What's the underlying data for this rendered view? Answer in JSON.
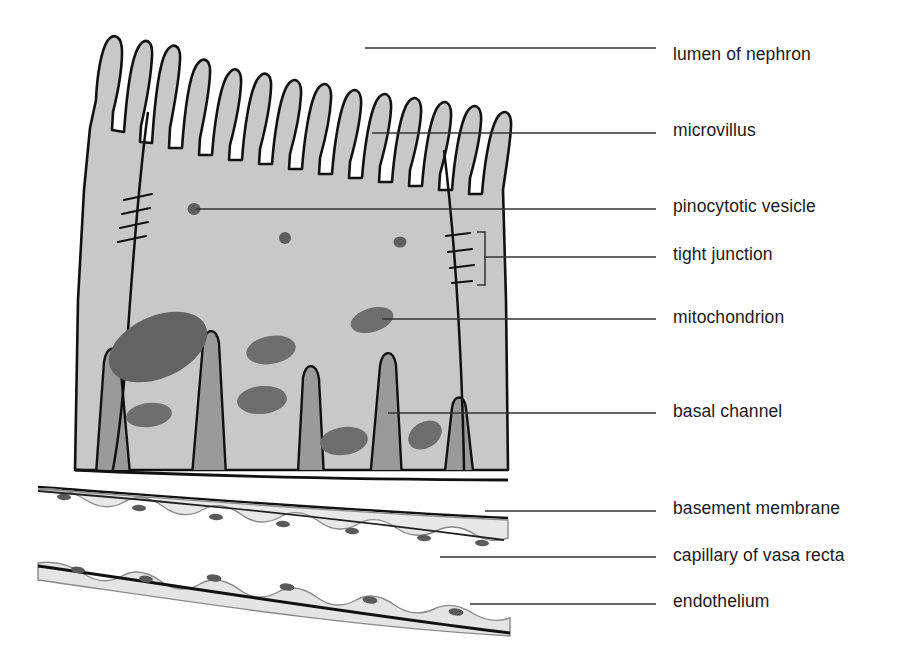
{
  "figure": {
    "background_color": "#ffffff",
    "line_color": "#111111",
    "leader_line_color": "#333333"
  },
  "palette": {
    "cytoplasm": "#c8c8c8",
    "cytoplasm_edge": "#bdbdbd",
    "organelle_dark": "#636363",
    "organelle_mid": "#6e6e6e",
    "basal_channel": "#9a9a9a",
    "membrane_band": "#e8e8e8",
    "endothelium_band": "#e4e4e4",
    "nucleus_dot": "#5a5a5a",
    "white": "#ffffff"
  },
  "labels": [
    {
      "id": "lumen-of-nephron",
      "text": "lumen of nephron",
      "text_x": 673,
      "text_y": 55,
      "leader_x1": 365,
      "leader_x2": 656,
      "leader_y": 48
    },
    {
      "id": "microvillus",
      "text": "microvillus",
      "text_x": 673,
      "text_y": 131,
      "leader_x1": 372,
      "leader_x2": 656,
      "leader_y": 133
    },
    {
      "id": "pinocytotic-vesicle",
      "text": "pinocytotic vesicle",
      "text_x": 673,
      "text_y": 207,
      "leader_x1": 196,
      "leader_x2": 656,
      "leader_y": 209
    },
    {
      "id": "tight-junction",
      "text": "tight junction",
      "text_x": 673,
      "text_y": 255,
      "leader_x1": 484,
      "leader_x2": 656,
      "leader_y": 257
    },
    {
      "id": "mitochondrion",
      "text": "mitochondrion",
      "text_x": 673,
      "text_y": 318,
      "leader_x1": 382,
      "leader_x2": 656,
      "leader_y": 319
    },
    {
      "id": "basal-channel",
      "text": "basal channel",
      "text_x": 673,
      "text_y": 412,
      "leader_x1": 388,
      "leader_x2": 656,
      "leader_y": 413
    },
    {
      "id": "basement-membrane",
      "text": "basement membrane",
      "text_x": 673,
      "text_y": 509,
      "leader_x1": 485,
      "leader_x2": 656,
      "leader_y": 511
    },
    {
      "id": "capillary-of-vasa-recta",
      "text": "capillary of vasa recta",
      "text_x": 673,
      "text_y": 556,
      "leader_x1": 440,
      "leader_x2": 656,
      "leader_y": 557
    },
    {
      "id": "endothelium",
      "text": "endothelium",
      "text_x": 673,
      "text_y": 602,
      "leader_x1": 470,
      "leader_x2": 656,
      "leader_y": 604
    }
  ],
  "diagram_parts": {
    "epithelial_cell": {
      "name": "tubule epithelial cell",
      "left_edge_x": 75,
      "right_edge_x": 510,
      "apex_y": 95,
      "base_y": 470
    },
    "microvilli": {
      "name": "microvilli",
      "count": 15,
      "span_x": [
        88,
        508
      ],
      "tip_y_range": [
        36,
        95
      ]
    },
    "tight_junctions": [
      {
        "name": "left tight junction",
        "x": 136,
        "y_range": [
          198,
          242
        ],
        "hash_count": 4
      },
      {
        "name": "right tight junction",
        "x": 462,
        "y_range": [
          233,
          282
        ],
        "hash_count": 4
      }
    ],
    "tight_junction_bracket": {
      "x": 477,
      "y_top": 232,
      "y_bottom": 285
    },
    "pinocytotic_vesicles": [
      {
        "cx": 194,
        "cy": 209,
        "rx": 6,
        "ry": 5.5
      },
      {
        "cx": 285,
        "cy": 238,
        "rx": 5.5,
        "ry": 5.5
      },
      {
        "cx": 400,
        "cy": 242,
        "rx": 6,
        "ry": 5
      }
    ],
    "nucleus": {
      "cx": 158,
      "cy": 347,
      "rx": 52,
      "ry": 31,
      "rotation": -24
    },
    "mitochondria": [
      {
        "cx": 271,
        "cy": 350,
        "rx": 25,
        "ry": 14,
        "rotation": -10
      },
      {
        "cx": 372,
        "cy": 320,
        "rx": 22,
        "ry": 12,
        "rotation": -16
      },
      {
        "cx": 149,
        "cy": 415,
        "rx": 23,
        "ry": 12,
        "rotation": -7
      },
      {
        "cx": 262,
        "cy": 400,
        "rx": 25,
        "ry": 14,
        "rotation": -5
      },
      {
        "cx": 344,
        "cy": 441,
        "rx": 24,
        "ry": 14,
        "rotation": -8
      },
      {
        "cx": 425,
        "cy": 435,
        "rx": 18,
        "ry": 13,
        "rotation": -32
      }
    ],
    "basal_channels": {
      "name": "basal channels",
      "count": 5,
      "base_x": [
        110,
        208,
        303,
        384,
        455
      ]
    },
    "basement_membrane": {
      "name": "basement membrane",
      "left_x": 38,
      "right_x": 508,
      "left_y": 487,
      "right_y": 518
    },
    "capillary_lumen": {
      "name": "capillary of vasa recta lumen",
      "top_y": 520,
      "bottom_y": 580
    },
    "endothelium": {
      "name": "endothelium",
      "left_x": 38,
      "right_x": 510,
      "left_y": 563,
      "right_y": 618,
      "nuclei_count": 6
    }
  }
}
